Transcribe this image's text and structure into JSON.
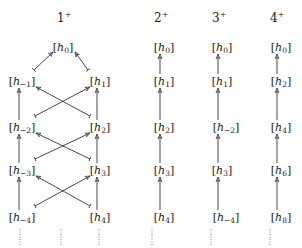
{
  "columns": [
    {
      "id": "col1",
      "label": "1",
      "label_sup": "+",
      "label_pos": [
        63,
        22
      ],
      "nodes": [
        {
          "id": "c1_h0",
          "base": "h",
          "sub": "0",
          "x": 63,
          "y": 47
        },
        {
          "id": "c1_hm1",
          "base": "h",
          "sub": "−1",
          "x": 22,
          "y": 81
        },
        {
          "id": "c1_h1",
          "base": "h",
          "sub": "1",
          "x": 100,
          "y": 81
        },
        {
          "id": "c1_hm2",
          "base": "h",
          "sub": "−2",
          "x": 22,
          "y": 127
        },
        {
          "id": "c1_h2",
          "base": "h",
          "sub": "2",
          "x": 100,
          "y": 127
        },
        {
          "id": "c1_hm3",
          "base": "h",
          "sub": "−3",
          "x": 22,
          "y": 170
        },
        {
          "id": "c1_h3",
          "base": "h",
          "sub": "3",
          "x": 100,
          "y": 170
        },
        {
          "id": "c1_hm4",
          "base": "h",
          "sub": "−4",
          "x": 22,
          "y": 217
        },
        {
          "id": "c1_h4",
          "base": "h",
          "sub": "4",
          "x": 100,
          "y": 217
        }
      ],
      "dots_x": [
        20,
        61,
        99
      ]
    },
    {
      "id": "col2",
      "label": "2",
      "label_sup": "+",
      "label_pos": [
        160,
        22
      ],
      "nodes": [
        {
          "id": "c2_0",
          "base": "h",
          "sub": "0",
          "x": 164,
          "y": 47
        },
        {
          "id": "c2_1",
          "base": "h",
          "sub": "1",
          "x": 164,
          "y": 81
        },
        {
          "id": "c2_2",
          "base": "h",
          "sub": "2",
          "x": 164,
          "y": 127
        },
        {
          "id": "c2_3",
          "base": "h",
          "sub": "3",
          "x": 164,
          "y": 170
        },
        {
          "id": "c2_4",
          "base": "h",
          "sub": "4",
          "x": 164,
          "y": 217
        }
      ],
      "dots_x": [
        152
      ]
    },
    {
      "id": "col3",
      "label": "3",
      "label_sup": "+",
      "label_pos": [
        218,
        22
      ],
      "nodes": [
        {
          "id": "c3_0",
          "base": "h",
          "sub": "0",
          "x": 222,
          "y": 47
        },
        {
          "id": "c3_1",
          "base": "h",
          "sub": "1",
          "x": 222,
          "y": 81
        },
        {
          "id": "c3_2",
          "base": "h",
          "sub": "−2",
          "x": 226,
          "y": 127
        },
        {
          "id": "c3_3",
          "base": "h",
          "sub": "3",
          "x": 222,
          "y": 170
        },
        {
          "id": "c3_4",
          "base": "h",
          "sub": "−4",
          "x": 226,
          "y": 217
        }
      ],
      "dots_x": [
        211
      ]
    },
    {
      "id": "col4",
      "label": "4",
      "label_sup": "+",
      "label_pos": [
        276,
        22
      ],
      "nodes": [
        {
          "id": "c4_0",
          "base": "h",
          "sub": "0",
          "x": 281,
          "y": 47
        },
        {
          "id": "c4_1",
          "base": "h",
          "sub": "2",
          "x": 281,
          "y": 81
        },
        {
          "id": "c4_2",
          "base": "h",
          "sub": "4",
          "x": 281,
          "y": 127
        },
        {
          "id": "c4_3",
          "base": "h",
          "sub": "6",
          "x": 281,
          "y": 170
        },
        {
          "id": "c4_4",
          "base": "h",
          "sub": "8",
          "x": 281,
          "y": 217
        }
      ],
      "dots_x": [
        270
      ]
    }
  ],
  "edges": [
    {
      "from": "c1_hm1",
      "to": "c1_h0",
      "type": "tail-arrow"
    },
    {
      "from": "c1_h1",
      "to": "c1_h0",
      "type": "tail-arrow"
    },
    {
      "from": "c1_hm2",
      "to": "c1_hm1",
      "type": "vertical"
    },
    {
      "from": "c1_h2",
      "to": "c1_h1",
      "type": "vertical"
    },
    {
      "from": "c1_hm2",
      "to": "c1_h1",
      "type": "cross"
    },
    {
      "from": "c1_h2",
      "to": "c1_hm1",
      "type": "cross"
    },
    {
      "from": "c1_hm3",
      "to": "c1_hm2",
      "type": "vertical"
    },
    {
      "from": "c1_h3",
      "to": "c1_h2",
      "type": "vertical"
    },
    {
      "from": "c1_hm3",
      "to": "c1_h2",
      "type": "cross"
    },
    {
      "from": "c1_h3",
      "to": "c1_hm2",
      "type": "cross"
    },
    {
      "from": "c1_hm4",
      "to": "c1_hm3",
      "type": "vertical"
    },
    {
      "from": "c1_h4",
      "to": "c1_h3",
      "type": "vertical"
    },
    {
      "from": "c1_hm4",
      "to": "c1_h3",
      "type": "cross"
    },
    {
      "from": "c1_h4",
      "to": "c1_hm3",
      "type": "cross"
    }
  ]
}
